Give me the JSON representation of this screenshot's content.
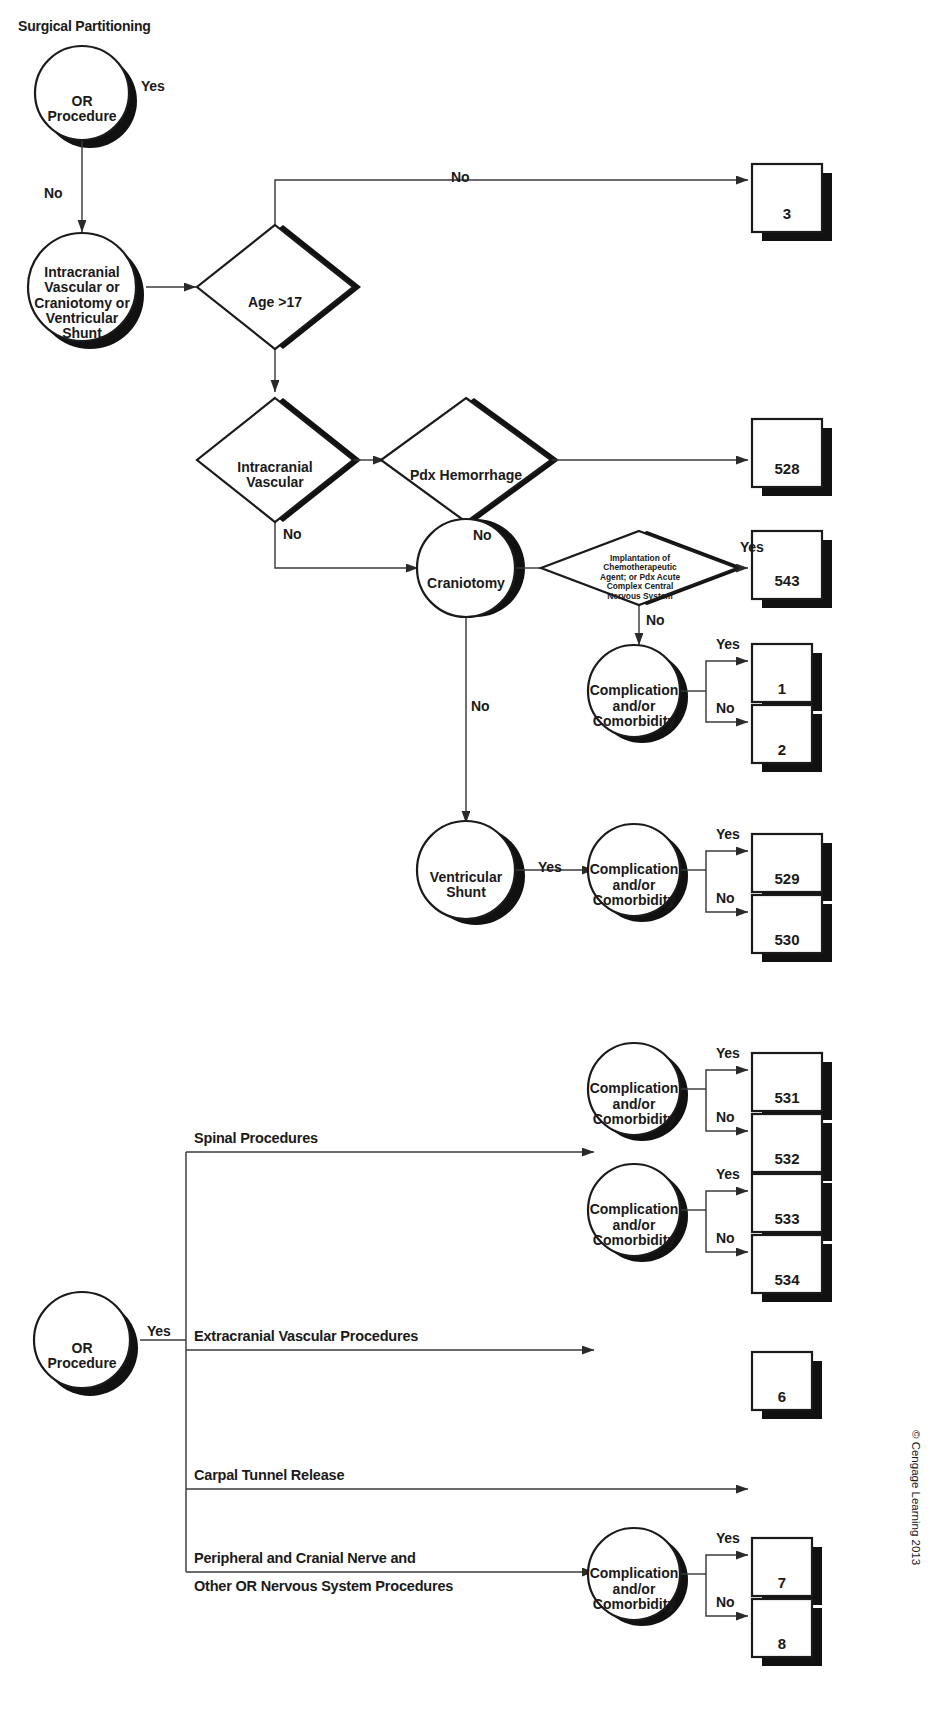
{
  "diagram": {
    "title": "Surgical Partitioning",
    "copyright": "© Cengage Learning 2013",
    "labels": {
      "yes": "Yes",
      "no": "No"
    },
    "nodes": {
      "or_procedure_top": "OR\nProcedure",
      "intracranial_group": "Intracranial\nVascular or\nCraniotomy or\nVentricular\nShunt",
      "age_gt_17": "Age >17",
      "intracranial_vascular": "Intracranial\nVascular",
      "pdx_hemorrhage": "Pdx Hemorrhage",
      "craniotomy": "Craniotomy",
      "chemo_implant": "Implantation of\nChemotherapeutic\nAgent; or Pdx Acute\nComplex Central\nNervous System",
      "complication_1": "Complication\nand/or\nComorbidity",
      "ventricular_shunt": "Ventricular\nShunt",
      "complication_2": "Complication\nand/or\nComorbidity",
      "or_procedure_bottom": "OR\nProcedure",
      "complication_spinal": "Complication\nand/or\nComorbidity",
      "complication_extracranial": "Complication\nand/or\nComorbidity",
      "complication_peripheral": "Complication\nand/or\nComorbidity"
    },
    "branch_labels": {
      "spinal": "Spinal Procedures",
      "extracranial": "Extracranial Vascular Procedures",
      "carpal": "Carpal Tunnel Release",
      "peripheral_line1": "Peripheral and Cranial Nerve and",
      "peripheral_line2": "Other OR Nervous System Procedures"
    },
    "terminals": {
      "t3": "3",
      "t528": "528",
      "t543": "543",
      "t1": "1",
      "t2": "2",
      "t529": "529",
      "t530": "530",
      "t531": "531",
      "t532": "532",
      "t533": "533",
      "t534": "534",
      "t6": "6",
      "t7": "7",
      "t8": "8"
    },
    "edge_labels": {
      "e1_yes": "Yes",
      "e2_no": "No",
      "e3_no": "No",
      "e4_no": "No",
      "e5_no": "No",
      "e6_no": "No",
      "e7_yes": "Yes",
      "e8_no": "No",
      "e9_yes": "Yes",
      "e10_no": "No",
      "e11_yes": "Yes",
      "e12_yes": "Yes",
      "e13_no": "No",
      "e14_yes": "Yes",
      "e15_no": "No",
      "e16_yes": "Yes",
      "e17_yes": "Yes",
      "e18_no": "No"
    },
    "colors": {
      "ink": "#1a1a1a",
      "shadow": "#111111",
      "paper": "#ffffff",
      "line": "#3b3b3b"
    }
  }
}
